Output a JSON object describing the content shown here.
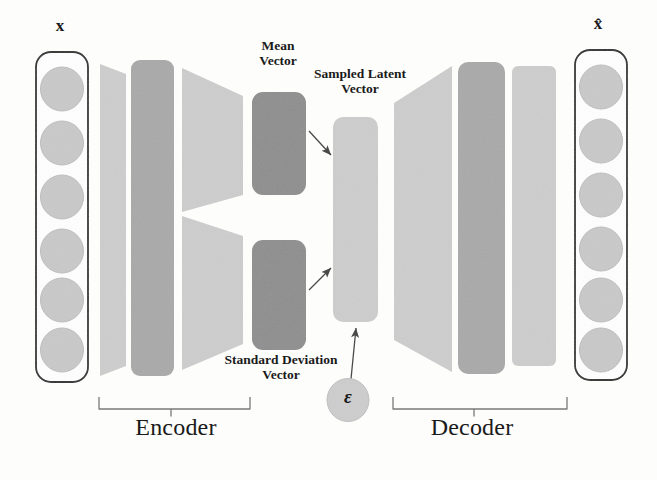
{
  "diagram": {
    "background_color": "#fdfdfc",
    "colors": {
      "light_gray": "#cdcdcd",
      "medium_gray": "#a9a9a9",
      "dark_gray": "#8e8e8e",
      "circle_fill": "#c9c9c9",
      "circle_stroke": "#b4b4b4",
      "outline": "#2b2b2b",
      "arrow": "#555555",
      "bracket": "#6f6f6f",
      "text": "#1a1a1a"
    },
    "labels": {
      "input_vector": "x",
      "output_vector": "x̂",
      "mean_vector": "Mean\nVector",
      "sampled_latent_vector": "Sampled Latent\nVector",
      "standard_deviation_vector": "Standard Deviation\nVector",
      "epsilon": "ε",
      "encoder": "Encoder",
      "decoder": "Decoder"
    },
    "input_layer": {
      "name": "input-vector-box",
      "node_count": 6,
      "box": {
        "x": 36,
        "y": 52,
        "w": 52,
        "h": 330
      }
    },
    "output_layer": {
      "name": "output-vector-box",
      "node_count": 6,
      "box": {
        "x": 575,
        "y": 50,
        "w": 52,
        "h": 330
      }
    },
    "encoder_layers": [
      {
        "name": "encoder-trapezoid-1",
        "shape": "trapezoid",
        "shade": "light_gray"
      },
      {
        "name": "encoder-hidden-rect",
        "shape": "rounded-rect",
        "shade": "medium_gray"
      },
      {
        "name": "encoder-trapezoid-2-split",
        "shape": "split-trapezoid",
        "shade": "light_gray"
      },
      {
        "name": "mean-vector-rect",
        "shape": "rounded-rect",
        "shade": "dark_gray"
      },
      {
        "name": "stddev-vector-rect",
        "shape": "rounded-rect",
        "shade": "dark_gray"
      }
    ],
    "latent": {
      "name": "sampled-latent-vector-rect",
      "shape": "rounded-rect",
      "shade": "light_gray"
    },
    "decoder_layers": [
      {
        "name": "decoder-trapezoid",
        "shape": "trapezoid",
        "shade": "light_gray"
      },
      {
        "name": "decoder-hidden-rect",
        "shape": "rounded-rect",
        "shade": "medium_gray"
      },
      {
        "name": "decoder-output-rect",
        "shape": "rounded-rect",
        "shade": "light_gray"
      }
    ],
    "arrows": [
      {
        "name": "arrow-mean-to-latent",
        "from": "mean-vector-rect",
        "to": "sampled-latent-vector-rect"
      },
      {
        "name": "arrow-stddev-to-latent",
        "from": "stddev-vector-rect",
        "to": "sampled-latent-vector-rect"
      },
      {
        "name": "arrow-epsilon-to-latent",
        "from": "epsilon-node",
        "to": "sampled-latent-vector-rect"
      }
    ],
    "brackets": [
      {
        "name": "encoder-bracket",
        "spans": "encoder-layers",
        "label": "Encoder"
      },
      {
        "name": "decoder-bracket",
        "spans": "decoder-layers",
        "label": "Decoder"
      }
    ]
  }
}
